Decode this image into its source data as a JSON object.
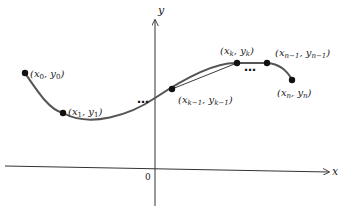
{
  "axes": {
    "x_label": "x",
    "y_label": "y",
    "origin_label": "0"
  },
  "points": [
    {
      "id": "p0",
      "label": "(x₀, y₀)",
      "var": "x",
      "sub": "0"
    },
    {
      "id": "p1",
      "label": "(x₁, y₁)",
      "var": "x",
      "sub": "1"
    },
    {
      "id": "pk1",
      "label": "(xₖ₋₁, yₖ₋₁)",
      "var": "x",
      "sub": "k−1"
    },
    {
      "id": "pk",
      "label": "(xₖ, yₖ)",
      "var": "x",
      "sub": "k"
    },
    {
      "id": "pn1",
      "label": "(xₙ₋₁, yₙ₋₁)",
      "var": "x",
      "sub": "n−1"
    },
    {
      "id": "pn",
      "label": "(xₙ, yₙ)",
      "var": "x",
      "sub": "n"
    }
  ],
  "ellipses": [
    "…",
    "…"
  ],
  "colors": {
    "curve": "#555555",
    "axis": "#333333",
    "point": "#111111"
  }
}
